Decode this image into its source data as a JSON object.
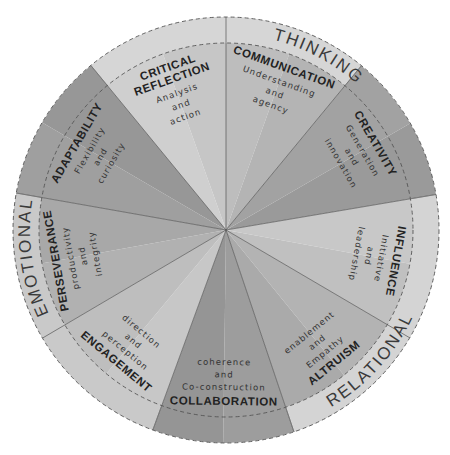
{
  "diagram": {
    "type": "segmented-wheel",
    "center": [
      226,
      230
    ],
    "outer_radius": 213,
    "inner_radius": 187,
    "bands": [
      {
        "label": "THINKING",
        "start_angle": -129.4,
        "end_angle": -50.5,
        "color": "#d6d6d6",
        "label_angle": -62
      },
      {
        "label": "RELATIONAL",
        "start_angle": -9.6,
        "end_angle": 71.4,
        "color": "#d4d4d4",
        "label_angle": 42
      },
      {
        "label": "EMOTIONAL",
        "start_angle": 110.1,
        "end_angle": 190,
        "color": "#c9c9c9",
        "label_angle": 172
      }
    ],
    "segments": [
      {
        "title": [
          "CRITICAL",
          "REFLECTION"
        ],
        "subtitle": [
          "Analysis",
          "and",
          "action"
        ],
        "start_angle": -129.4,
        "end_angle": -90,
        "color": "#cfcfcf",
        "shade": "#c6c6c6"
      },
      {
        "title": [
          "COMMUNICATION"
        ],
        "subtitle": [
          "Understanding",
          "and",
          "agency"
        ],
        "start_angle": -90,
        "end_angle": -50.5,
        "color": "#bdbdbd",
        "shade": "#b4b4b4"
      },
      {
        "title": [
          "CREATIVITY"
        ],
        "subtitle": [
          "Generation",
          "and",
          "innovation"
        ],
        "start_angle": -50.5,
        "end_angle": -9.6,
        "color": "#a2a2a2",
        "shade": "#9a9a9a"
      },
      {
        "title": [
          "INFLUENCE"
        ],
        "subtitle": [
          "Initiative",
          "and",
          "leadership"
        ],
        "start_angle": -9.6,
        "end_angle": 30.4,
        "color": "#c8c8c8",
        "shade": "#c0c0c0"
      },
      {
        "title": [
          "ALTRUISM"
        ],
        "subtitle": [
          "Empathy",
          "and",
          "enablement"
        ],
        "start_angle": 30.4,
        "end_angle": 71.4,
        "color": "#b3b3b3",
        "shade": "#aaaaaa"
      },
      {
        "title": [
          "COLLABORATION"
        ],
        "subtitle": [
          "Co-construction",
          "and",
          "coherence"
        ],
        "start_angle": 71.4,
        "end_angle": 110.1,
        "color": "#9d9d9d",
        "shade": "#959595"
      },
      {
        "title": [
          "ENGAGEMENT"
        ],
        "subtitle": [
          "perception",
          "and",
          "direction"
        ],
        "start_angle": 110.1,
        "end_angle": 149.5,
        "color": "#c7c7c7",
        "shade": "#bebebe"
      },
      {
        "title": [
          "PERSEVERANCE"
        ],
        "subtitle": [
          "productivity",
          "and",
          "integrity"
        ],
        "start_angle": 149.5,
        "end_angle": 190,
        "color": "#b1b1b1",
        "shade": "#a8a8a8"
      },
      {
        "title": [
          "ADAPTABILITY"
        ],
        "subtitle": [
          "Flexibility",
          "and",
          "curiosity"
        ],
        "start_angle": 190,
        "end_angle": 230.6,
        "color": "#9f9f9f",
        "shade": "#979797"
      }
    ]
  }
}
